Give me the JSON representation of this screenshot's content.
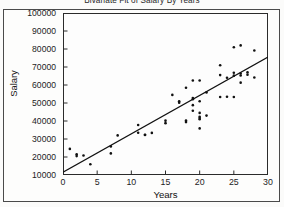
{
  "report": {
    "title": "Bivariate Fit of Salary By Years"
  },
  "chart_data": {
    "type": "scatter",
    "title": "Bivariate Fit of Salary By Years",
    "xlabel": "Years",
    "ylabel": "Salary",
    "xlim": [
      0,
      30
    ],
    "ylim": [
      10000,
      100000
    ],
    "xticks": [
      0,
      5,
      10,
      15,
      20,
      25,
      30
    ],
    "yticks": [
      10000,
      20000,
      30000,
      40000,
      50000,
      60000,
      70000,
      80000,
      90000,
      100000
    ],
    "xtick_labels": [
      "0",
      "5",
      "10",
      "15",
      "20",
      "25",
      "30"
    ],
    "ytick_labels": [
      "10000",
      "20000",
      "30000",
      "40000",
      "50000",
      "60000",
      "70000",
      "80000",
      "90000",
      "100000"
    ],
    "grid": false,
    "legend": "none",
    "marker": {
      "shape": "circle",
      "color": "#111111",
      "size": 2.6
    },
    "fit_line": {
      "type": "linear",
      "color": "#111111",
      "x_start": 0,
      "y_start": 11500,
      "x_end": 30,
      "y_end": 75500,
      "slope": 2133,
      "intercept": 11500
    },
    "series": [
      {
        "name": "Salary vs Years",
        "points": [
          [
            1,
            24500
          ],
          [
            2,
            21500
          ],
          [
            2,
            20500
          ],
          [
            3,
            20800
          ],
          [
            4,
            16000
          ],
          [
            7,
            22000
          ],
          [
            7,
            25900
          ],
          [
            8,
            32000
          ],
          [
            11,
            37800
          ],
          [
            11,
            33500
          ],
          [
            12,
            32200
          ],
          [
            12,
            32400
          ],
          [
            13,
            33400
          ],
          [
            15,
            38800
          ],
          [
            15,
            40200
          ],
          [
            16,
            54500
          ],
          [
            17,
            50200
          ],
          [
            17,
            51000
          ],
          [
            18,
            58500
          ],
          [
            18,
            39400
          ],
          [
            18,
            40300
          ],
          [
            19,
            62500
          ],
          [
            19,
            52800
          ],
          [
            19,
            52100
          ],
          [
            19,
            45700
          ],
          [
            19,
            48800
          ],
          [
            20,
            62500
          ],
          [
            20,
            51000
          ],
          [
            20,
            44500
          ],
          [
            20,
            42300
          ],
          [
            20,
            41600
          ],
          [
            20,
            41000
          ],
          [
            20,
            35900
          ],
          [
            21,
            55900
          ],
          [
            21,
            43000
          ],
          [
            23,
            71000
          ],
          [
            23,
            65500
          ],
          [
            23,
            53300
          ],
          [
            24,
            53500
          ],
          [
            24,
            64000
          ],
          [
            25,
            81000
          ],
          [
            25,
            66800
          ],
          [
            25,
            65200
          ],
          [
            25,
            53300
          ],
          [
            26,
            82000
          ],
          [
            26,
            66400
          ],
          [
            26,
            65300
          ],
          [
            26,
            61300
          ],
          [
            27,
            67000
          ],
          [
            27,
            65700
          ],
          [
            28,
            79200
          ],
          [
            28,
            64200
          ]
        ]
      }
    ]
  }
}
